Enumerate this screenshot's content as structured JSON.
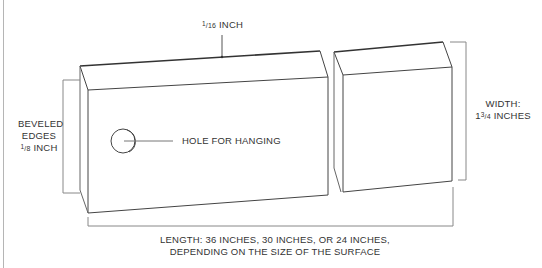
{
  "labels": {
    "thickness": {
      "num": "1",
      "den": "16",
      "unit": "INCH"
    },
    "beveled": {
      "line1": "BEVELED",
      "line2": "EDGES",
      "num": "1",
      "den": "8",
      "unit": "INCH"
    },
    "hole": "HOLE FOR HANGING",
    "width": {
      "line1": "WIDTH:",
      "whole": "1",
      "num": "3",
      "den": "4",
      "unit": "INCHES"
    },
    "length": {
      "line1": "LENGTH: 36 INCHES, 30 INCHES, OR 24 INCHES,",
      "line2": "DEPENDING ON THE SIZE OF THE SURFACE"
    }
  },
  "colors": {
    "line": "#444444",
    "dim_line": "#9a9a9a",
    "background": "#ffffff"
  }
}
